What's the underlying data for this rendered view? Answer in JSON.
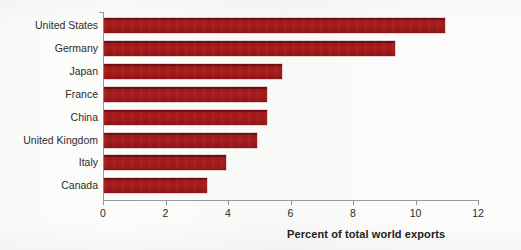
{
  "chart_data": {
    "type": "bar",
    "orientation": "horizontal",
    "title": "",
    "subtitle": "",
    "xlabel": "Percent of total world exports",
    "ylabel": "",
    "xlim": [
      0,
      12
    ],
    "xticks": [
      0,
      2,
      4,
      6,
      8,
      10,
      12
    ],
    "xtick_labels": [
      "0",
      "2",
      "4",
      "6",
      "8",
      "10",
      "12"
    ],
    "grid": false,
    "legend": false,
    "legend_position": "none",
    "bar_color": "#a81d1d",
    "categories": [
      "United States",
      "Germany",
      "Japan",
      "France",
      "China",
      "United Kingdom",
      "Italy",
      "Canada"
    ],
    "values": [
      10.9,
      9.3,
      5.7,
      5.2,
      5.2,
      4.9,
      3.9,
      3.3
    ]
  },
  "axis": {
    "x_title": "Percent of total world exports"
  }
}
